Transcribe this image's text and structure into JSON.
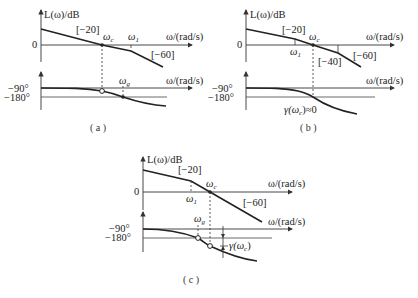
{
  "diagrams": [
    {
      "id": "a",
      "caption": "(a)",
      "magnitude": {
        "ylabel": "L(ω)/dB",
        "xlabel": "ω/(rad/s)",
        "zero_label": "0",
        "slopes": [
          "[−20]",
          "[−60]"
        ],
        "markers": [
          "ωc",
          "ω1"
        ]
      },
      "phase": {
        "xlabel": "ω/(rad/s)",
        "ref_labels": [
          "−90°",
          "−180°"
        ],
        "markers": [
          "ωg"
        ]
      }
    },
    {
      "id": "b",
      "caption": "(b)",
      "magnitude": {
        "ylabel": "L(ω)/dB",
        "xlabel": "ω/(rad/s)",
        "zero_label": "0",
        "slopes": [
          "[−20]",
          "[−40]",
          "[−60]"
        ],
        "markers": [
          "ω1",
          "ωc"
        ]
      },
      "phase": {
        "xlabel": "ω/(rad/s)",
        "ref_labels": [
          "−90°",
          "−180°"
        ],
        "annotation": "γ(ωc)≈0"
      }
    },
    {
      "id": "c",
      "caption": "(c)",
      "magnitude": {
        "ylabel": "L(ω)/dB",
        "xlabel": "ω/(rad/s)",
        "zero_label": "0",
        "slopes": [
          "[−20]",
          "[−60]"
        ],
        "markers": [
          "ω1",
          "ωc"
        ]
      },
      "phase": {
        "xlabel": "ω/(rad/s)",
        "ref_labels": [
          "−90°",
          "−180°"
        ],
        "markers": [
          "ωg"
        ],
        "annotation": "γ(ωc)"
      }
    }
  ],
  "text": {
    "L": "L(ω)/dB",
    "w_axis": "ω/(rad/s)",
    "zero": "0",
    "m90": "−90°",
    "m180": "−180°",
    "s20": "[−20]",
    "s40": "[−40]",
    "s60": "[−60]",
    "omega": "ω",
    "c": "c",
    "g": "g",
    "one": "1",
    "gamma_b": "γ(ω",
    "gamma_b_tail": ")≈0",
    "gamma_c": "γ(ω",
    "gamma_c_tail": ")",
    "cap_a": "( a )",
    "cap_b": "( b )",
    "cap_c": "( c )"
  }
}
